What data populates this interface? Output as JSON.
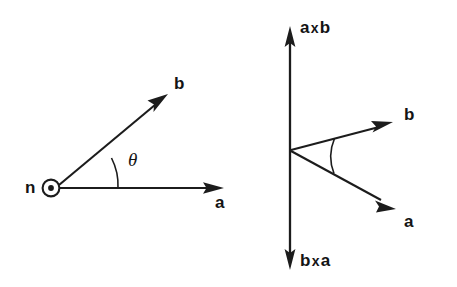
{
  "figure": {
    "background_color": "#ffffff",
    "ink_color": "#1c1c1c",
    "panels": [
      {
        "id": "left-panel",
        "name": "plane-view",
        "description": "Vectors a and b drawn in the plane of the page with angle theta between them and normal n coming out of the page",
        "labels": {
          "normal": "n",
          "vector_a": "a",
          "vector_b": "b",
          "angle": "θ"
        },
        "normal_symbol": "circle-dot-out-of-page"
      },
      {
        "id": "right-panel",
        "name": "cross-product-view",
        "description": "Vectors a and b fanned out from a common origin with the a-cross-b axis pointing up and b-cross-a axis pointing down",
        "labels": {
          "vector_a": "a",
          "vector_b": "b",
          "up_axis": {
            "first": "a",
            "operator": "x",
            "second": "b"
          },
          "down_axis": {
            "first": "b",
            "operator": "x",
            "second": "a"
          }
        }
      }
    ]
  },
  "geometry": {
    "left": {
      "origin": {
        "x": 58,
        "y": 188
      },
      "dot_center": {
        "x": 51,
        "y": 188
      },
      "dot_outer_r": 8.5,
      "dot_inner_r": 2.8,
      "a_tip": {
        "x": 222,
        "y": 188
      },
      "b_tip": {
        "x": 166,
        "y": 95
      },
      "arc_radius": 60,
      "angle_degrees": 29
    },
    "right": {
      "origin": {
        "x": 290,
        "y": 150
      },
      "axis_top": {
        "x": 290,
        "y": 28
      },
      "axis_bottom": {
        "x": 290,
        "y": 268
      },
      "b_tip": {
        "x": 392,
        "y": 122
      },
      "a_tip": {
        "x": 396,
        "y": 212
      },
      "arc_radius": 45
    }
  }
}
